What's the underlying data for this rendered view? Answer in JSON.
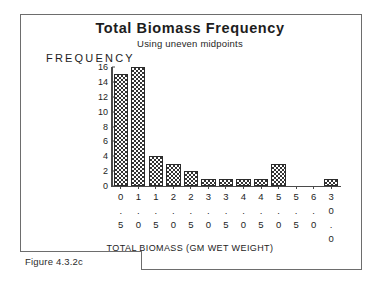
{
  "figure": {
    "caption": "Figure 4.3.2c"
  },
  "chart_data": {
    "type": "bar",
    "title": "Total Biomass Frequency",
    "subtitle": "Using uneven midpoints",
    "xlabel": "TOTAL BIOMASS (GM WET WEIGHT)",
    "ylabel": "FREQUENCY",
    "categories": [
      "0.5",
      "1.0",
      "1.5",
      "2.0",
      "2.5",
      "3.0",
      "3.5",
      "4.0",
      "4.5",
      "5.0",
      "5.5",
      "6.0",
      "30.0"
    ],
    "values": [
      15,
      16,
      4,
      3,
      2,
      1,
      1,
      1,
      1,
      3,
      0,
      0,
      1
    ],
    "ylim": [
      0,
      16
    ],
    "yticks": [
      0,
      2,
      4,
      6,
      8,
      10,
      12,
      14,
      16
    ],
    "grid": false,
    "legend": false,
    "bar_fill": "crosshatch",
    "bar_color": "#333333",
    "axis_color": "#4a4a4a"
  }
}
